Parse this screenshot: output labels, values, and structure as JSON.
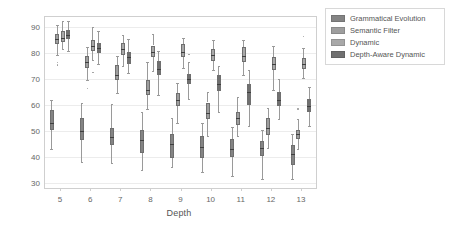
{
  "chart_data": {
    "type": "box",
    "title": "",
    "xlabel": "Depth",
    "ylabel": "Successes",
    "categories": [
      5,
      6,
      7,
      8,
      9,
      10,
      11,
      12,
      13
    ],
    "xlim": [
      4.5,
      13.5
    ],
    "ylim": [
      28,
      94
    ],
    "yticks": [
      30,
      40,
      50,
      60,
      70,
      80,
      90
    ],
    "xticks": [
      5,
      6,
      7,
      8,
      9,
      10,
      11,
      12,
      13
    ],
    "grid": "horizontal",
    "legend_position": "outside-top-right",
    "series": [
      {
        "name": "Grammatical Evolution",
        "color": "#848484",
        "boxes": [
          {
            "category": 5,
            "whisker_low": 43.0,
            "q1": 50.5,
            "median": 53.0,
            "q3": 58.0,
            "whisker_high": 62.0,
            "fliers": []
          },
          {
            "category": 6,
            "whisker_low": 38.0,
            "q1": 46.5,
            "median": 50.0,
            "q3": 55.0,
            "whisker_high": 61.0,
            "fliers": []
          },
          {
            "category": 7,
            "whisker_low": 37.5,
            "q1": 44.5,
            "median": 47.5,
            "q3": 51.0,
            "whisker_high": 60.5,
            "fliers": []
          },
          {
            "category": 8,
            "whisker_low": 35.0,
            "q1": 41.5,
            "median": 46.5,
            "q3": 50.5,
            "whisker_high": 57.5,
            "fliers": []
          },
          {
            "category": 9,
            "whisker_low": 36.0,
            "q1": 39.5,
            "median": 45.0,
            "q3": 49.0,
            "whisker_high": 55.0,
            "fliers": []
          },
          {
            "category": 10,
            "whisker_low": 34.0,
            "q1": 39.5,
            "median": 44.0,
            "q3": 48.0,
            "whisker_high": 53.0,
            "fliers": []
          },
          {
            "category": 11,
            "whisker_low": 32.5,
            "q1": 40.0,
            "median": 43.0,
            "q3": 47.0,
            "whisker_high": 51.5,
            "fliers": []
          },
          {
            "category": 12,
            "whisker_low": 31.5,
            "q1": 40.5,
            "median": 43.5,
            "q3": 46.0,
            "whisker_high": 50.5,
            "fliers": []
          },
          {
            "category": 13,
            "whisker_low": 31.5,
            "q1": 37.0,
            "median": 41.0,
            "q3": 44.5,
            "whisker_high": 49.0,
            "fliers": []
          }
        ]
      },
      {
        "name": "Semantic Filter",
        "color": "#9e9e9e",
        "boxes": [
          {
            "category": 5,
            "whisker_low": 79.5,
            "q1": 83.5,
            "median": 85.5,
            "q3": 87.5,
            "whisker_high": 91.0,
            "fliers": [
              75.5,
              76.5
            ]
          },
          {
            "category": 6,
            "whisker_low": 69.5,
            "q1": 74.5,
            "median": 76.5,
            "q3": 79.0,
            "whisker_high": 82.5,
            "fliers": [
              66.5
            ]
          },
          {
            "category": 7,
            "whisker_low": 64.5,
            "q1": 69.5,
            "median": 71.5,
            "q3": 75.5,
            "whisker_high": 79.0,
            "fliers": []
          },
          {
            "category": 8,
            "whisker_low": 58.5,
            "q1": 64.0,
            "median": 66.0,
            "q3": 69.5,
            "whisker_high": 76.5,
            "fliers": []
          },
          {
            "category": 9,
            "whisker_low": 53.0,
            "q1": 59.5,
            "median": 62.0,
            "q3": 64.5,
            "whisker_high": 68.5,
            "fliers": []
          },
          {
            "category": 10,
            "whisker_low": 48.0,
            "q1": 54.5,
            "median": 57.0,
            "q3": 61.0,
            "whisker_high": 65.0,
            "fliers": []
          },
          {
            "category": 11,
            "whisker_low": 48.0,
            "q1": 52.5,
            "median": 55.0,
            "q3": 57.5,
            "whisker_high": 63.0,
            "fliers": []
          },
          {
            "category": 12,
            "whisker_low": 43.5,
            "q1": 48.5,
            "median": 51.0,
            "q3": 55.0,
            "whisker_high": 59.0,
            "fliers": []
          },
          {
            "category": 13,
            "whisker_low": 43.0,
            "q1": 47.0,
            "median": 49.0,
            "q3": 50.5,
            "whisker_high": 54.5,
            "fliers": [
              58.5
            ]
          }
        ]
      },
      {
        "name": "Dynamic",
        "color": "#a8a8a8",
        "boxes": [
          {
            "category": 5,
            "whisker_low": 81.5,
            "q1": 84.5,
            "median": 86.0,
            "q3": 88.5,
            "whisker_high": 92.5,
            "fliers": []
          },
          {
            "category": 6,
            "whisker_low": 77.5,
            "q1": 81.0,
            "median": 83.0,
            "q3": 85.0,
            "whisker_high": 90.0,
            "fliers": [
              72.5
            ]
          },
          {
            "category": 7,
            "whisker_low": 75.0,
            "q1": 79.5,
            "median": 81.5,
            "q3": 84.0,
            "whisker_high": 87.0,
            "fliers": []
          },
          {
            "category": 8,
            "whisker_low": 73.0,
            "q1": 78.5,
            "median": 80.5,
            "q3": 83.0,
            "whisker_high": 87.5,
            "fliers": []
          },
          {
            "category": 9,
            "whisker_low": 74.5,
            "q1": 78.5,
            "median": 80.5,
            "q3": 83.5,
            "whisker_high": 86.0,
            "fliers": []
          },
          {
            "category": 10,
            "whisker_low": 73.5,
            "q1": 77.0,
            "median": 79.5,
            "q3": 81.5,
            "whisker_high": 85.0,
            "fliers": []
          },
          {
            "category": 11,
            "whisker_low": 71.5,
            "q1": 76.5,
            "median": 79.0,
            "q3": 82.5,
            "whisker_high": 85.0,
            "fliers": []
          },
          {
            "category": 12,
            "whisker_low": 66.0,
            "q1": 73.5,
            "median": 76.0,
            "q3": 78.5,
            "whisker_high": 83.0,
            "fliers": []
          },
          {
            "category": 13,
            "whisker_low": 70.5,
            "q1": 74.0,
            "median": 76.0,
            "q3": 78.0,
            "whisker_high": 82.0,
            "fliers": [
              86.5
            ]
          }
        ]
      },
      {
        "name": "Depth-Aware Dynamic",
        "color": "#707070",
        "boxes": [
          {
            "category": 5,
            "whisker_low": 81.0,
            "q1": 85.5,
            "median": 87.0,
            "q3": 89.0,
            "whisker_high": 92.5,
            "fliers": []
          },
          {
            "category": 6,
            "whisker_low": 76.0,
            "q1": 80.0,
            "median": 82.0,
            "q3": 84.0,
            "whisker_high": 88.5,
            "fliers": []
          },
          {
            "category": 7,
            "whisker_low": 72.5,
            "q1": 76.0,
            "median": 78.5,
            "q3": 80.5,
            "whisker_high": 85.5,
            "fliers": []
          },
          {
            "category": 8,
            "whisker_low": 64.0,
            "q1": 71.5,
            "median": 74.0,
            "q3": 77.0,
            "whisker_high": 81.0,
            "fliers": []
          },
          {
            "category": 9,
            "whisker_low": 62.5,
            "q1": 68.0,
            "median": 70.0,
            "q3": 72.0,
            "whisker_high": 76.5,
            "fliers": [
              79.5
            ]
          },
          {
            "category": 10,
            "whisker_low": 57.5,
            "q1": 65.5,
            "median": 68.0,
            "q3": 71.5,
            "whisker_high": 75.0,
            "fliers": []
          },
          {
            "category": 11,
            "whisker_low": 52.0,
            "q1": 60.0,
            "median": 65.0,
            "q3": 68.0,
            "whisker_high": 73.5,
            "fliers": []
          },
          {
            "category": 12,
            "whisker_low": 54.5,
            "q1": 59.5,
            "median": 62.0,
            "q3": 65.0,
            "whisker_high": 70.0,
            "fliers": []
          },
          {
            "category": 13,
            "whisker_low": 52.0,
            "q1": 57.5,
            "median": 59.5,
            "q3": 62.5,
            "whisker_high": 67.0,
            "fliers": []
          }
        ]
      }
    ]
  },
  "legend": {
    "items": [
      {
        "label": "Grammatical Evolution"
      },
      {
        "label": "Semantic Filter"
      },
      {
        "label": "Dynamic"
      },
      {
        "label": "Depth-Aware Dynamic"
      }
    ]
  },
  "axes": {
    "xlabel": "Depth",
    "ylabel": "Successes"
  }
}
